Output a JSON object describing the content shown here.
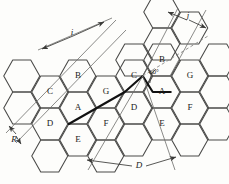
{
  "figure": {
    "type": "hexagonal-cell-reuse-diagram",
    "colors": {
      "background": "#fdfdfb",
      "hex_stroke": "#4a4a48",
      "bold_stroke": "#111111",
      "thin_stroke": "#6d6d6b",
      "dashed_stroke": "#8a8a88",
      "text": "#1a1a1a"
    },
    "hex": {
      "radius": 18.5,
      "orientation": "flat-top"
    }
  },
  "cells": [
    {
      "id": "c-left-B",
      "label": "B",
      "x": 78,
      "y": 76
    },
    {
      "id": "c-left-C",
      "label": "C",
      "x": 50,
      "y": 92
    },
    {
      "id": "c-left-G",
      "label": "G",
      "x": 106,
      "y": 92
    },
    {
      "id": "c-left-D",
      "label": "D",
      "x": 50,
      "y": 124
    },
    {
      "id": "c-left-A",
      "label": "A",
      "x": 78,
      "y": 108
    },
    {
      "id": "c-left-F",
      "label": "F",
      "x": 106,
      "y": 124
    },
    {
      "id": "c-left-E",
      "label": "E",
      "x": 78,
      "y": 140
    },
    {
      "id": "c-right-B",
      "label": "B",
      "x": 162,
      "y": 60
    },
    {
      "id": "c-right-C",
      "label": "C",
      "x": 134,
      "y": 76
    },
    {
      "id": "c-right-G",
      "label": "G",
      "x": 190,
      "y": 76
    },
    {
      "id": "c-right-A",
      "label": "A",
      "x": 162,
      "y": 92
    },
    {
      "id": "c-right-D",
      "label": "D",
      "x": 134,
      "y": 108
    },
    {
      "id": "c-right-F",
      "label": "F",
      "x": 190,
      "y": 108
    },
    {
      "id": "c-right-E",
      "label": "E",
      "x": 162,
      "y": 124
    }
  ],
  "dimensions": [
    {
      "id": "dim-i",
      "label": "i",
      "x": 72,
      "y": 33
    },
    {
      "id": "dim-j",
      "label": "j",
      "x": 188,
      "y": 17
    },
    {
      "id": "dim-R",
      "label": "R",
      "x": 14,
      "y": 139
    },
    {
      "id": "dim-D",
      "label": "D",
      "x": 138,
      "y": 165
    }
  ],
  "angle": {
    "id": "angle-60",
    "label": "60°",
    "x": 153,
    "y": 71
  }
}
